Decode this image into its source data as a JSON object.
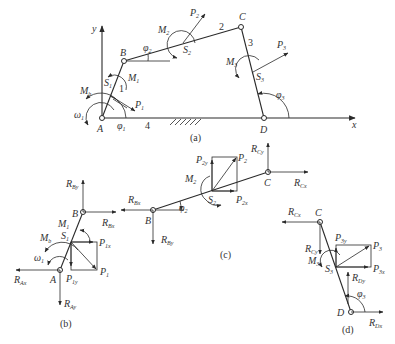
{
  "figure": {
    "panels": [
      {
        "id": "a",
        "caption": "(a)",
        "title": "Four-bar linkage ABCD"
      },
      {
        "id": "b",
        "caption": "(b)",
        "title": "Free body of link 1"
      },
      {
        "id": "c",
        "caption": "(c)",
        "title": "Free body of link 2"
      },
      {
        "id": "d",
        "caption": "(d)",
        "title": "Free body of link 3"
      }
    ],
    "panel_a": {
      "axes": {
        "x": "x",
        "y": "y"
      },
      "joints": {
        "A": "A",
        "B": "B",
        "C": "C",
        "D": "D"
      },
      "links": {
        "l1": "1",
        "l2": "2",
        "l3": "3",
        "l4": "4"
      },
      "centers": {
        "S1": "S",
        "S1sub": "1",
        "S2": "S",
        "S2sub": "2",
        "S3": "S",
        "S3sub": "3"
      },
      "forces": {
        "P1": "P",
        "P1sub": "1",
        "P2": "P",
        "P2sub": "2",
        "P3": "P",
        "P3sub": "3"
      },
      "moments": {
        "M1": "M",
        "M1sub": "1",
        "M2": "M",
        "M2sub": "2",
        "M3": "M",
        "M3sub": "3",
        "Mb": "M",
        "Mbsub": "b"
      },
      "angles": {
        "phi1": "φ",
        "phi1sub": "1",
        "phi2": "φ",
        "phi2sub": "2",
        "phi3": "φ",
        "phi3sub": "3"
      },
      "omega": {
        "sym": "ω",
        "sub": "1"
      }
    },
    "panel_b": {
      "joints": {
        "A": "A",
        "B": "B"
      },
      "S": "S",
      "Ssub": "1",
      "labels": {
        "RBy": "R",
        "RBysub": "By",
        "RBx": "R",
        "RBxsub": "Bx",
        "RAx": "R",
        "RAxsub": "Ax",
        "RAy": "R",
        "RAysub": "Ay",
        "P1": "P",
        "P1sub": "1",
        "P1x": "P",
        "P1xsub": "1x",
        "P1y": "P",
        "P1ysub": "1y",
        "M1": "M",
        "M1sub": "1",
        "Mb": "M",
        "Mbsub": "b",
        "omega": "ω",
        "omegasub": "1"
      }
    },
    "panel_c": {
      "joints": {
        "B": "B",
        "C": "C"
      },
      "S": "S",
      "Ssub": "2",
      "labels": {
        "RBx": "R",
        "RBxsub": "Bx",
        "RBy": "R",
        "RBysub": "By",
        "RCx": "R",
        "RCxsub": "Cx",
        "RCy": "R",
        "RCysub": "Cy",
        "P2": "P",
        "P2sub": "2",
        "P2x": "P",
        "P2xsub": "2x",
        "P2y": "P",
        "P2ysub": "2y",
        "M2": "M",
        "M2sub": "2",
        "phi2": "φ",
        "phi2sub": "2"
      }
    },
    "panel_d": {
      "joints": {
        "C": "C",
        "D": "D"
      },
      "S": "S",
      "Ssub": "3",
      "labels": {
        "RCx": "R",
        "RCxsub": "Cx",
        "RCy": "R",
        "RCysub": "Cy",
        "RDx": "R",
        "RDxsub": "Dx",
        "RDy": "R",
        "RDysub": "Dy",
        "P3": "P",
        "P3sub": "3",
        "P3x": "P",
        "P3xsub": "3x",
        "P3y": "P",
        "P3ysub": "3y",
        "M3": "M",
        "M3sub": "3",
        "phi3": "φ",
        "phi3sub": "3"
      }
    }
  }
}
